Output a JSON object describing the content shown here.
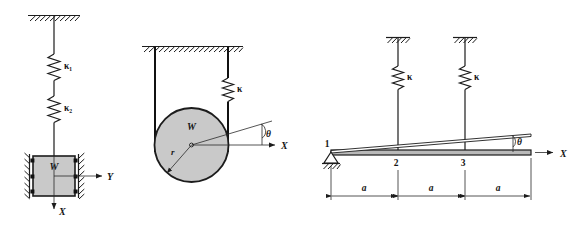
{
  "figure": {
    "background_color": "#ffffff",
    "line_color": "#1c1c1c",
    "fill_color": "#c9c9c9",
    "width": 582,
    "height": 225
  },
  "diagram_left": {
    "name": "two-springs-in-series-with-guided-mass",
    "spring_top_label": "κ₁",
    "spring_bottom_label": "κ₂",
    "mass_label": "W",
    "axis_horizontal_label": "Y",
    "axis_vertical_label": "X",
    "support": "fixed-ceiling-hatched",
    "guides": "hatched-walls-with-rollers"
  },
  "diagram_middle": {
    "name": "pulley-disk-with-cable-and-spring",
    "disk_label": "W",
    "radius_label": "r",
    "spring_label": "κ",
    "angle_label": "θ",
    "axis_label": "X",
    "support": "fixed-ceiling-hatched"
  },
  "diagram_right": {
    "name": "rigid-bar-on-pin-support-with-two-springs",
    "node_labels": [
      "1",
      "2",
      "3"
    ],
    "spring_labels": [
      "κ",
      "κ"
    ],
    "angle_label": "θ",
    "axis_label": "X",
    "dimension_labels": [
      "a",
      "a",
      "a"
    ],
    "support": "pin-support-hatched"
  }
}
